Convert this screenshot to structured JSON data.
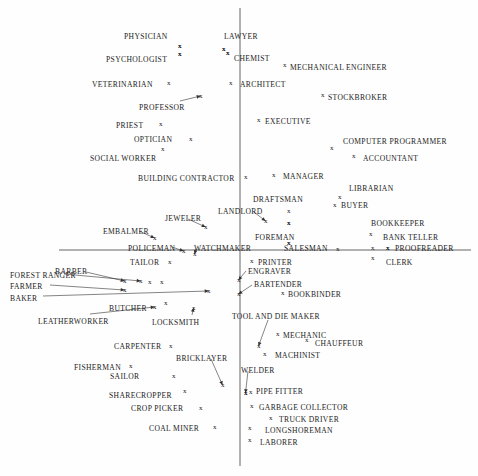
{
  "chart_data": {
    "type": "scatter",
    "title": "",
    "subtitle": "",
    "xlabel": "",
    "ylabel": "",
    "grid": false,
    "legend": "none",
    "axes": {
      "vertical_line_x": 240,
      "vertical_line_y0": 8,
      "vertical_line_y1": 466,
      "horizontal_line_y": 250,
      "horizontal_line_x0": 59,
      "horizontal_line_x1": 471,
      "color": "#555555"
    },
    "marker_glyph": "x",
    "points": [
      {
        "label": "PHYSICIAN",
        "lx": 124,
        "ly": 33,
        "mx": 178,
        "my": 43,
        "leader": false
      },
      {
        "label": "LAWYER",
        "lx": 224,
        "ly": 33,
        "mx": 222,
        "my": 46,
        "leader": false
      },
      {
        "label": "PSYCHOLOGIST",
        "lx": 106,
        "ly": 56,
        "mx": 178,
        "my": 51,
        "leader": false
      },
      {
        "label": "CHEMIST",
        "lx": 234,
        "ly": 55,
        "mx": 226,
        "my": 50,
        "leader": false
      },
      {
        "label": "MECHANICAL ENGINEER",
        "lx": 290,
        "ly": 64,
        "mx": 283,
        "my": 62,
        "leader": false
      },
      {
        "label": "VETERINARIAN",
        "lx": 92,
        "ly": 81,
        "mx": 167,
        "my": 80,
        "leader": false
      },
      {
        "label": "ARCHITECT",
        "lx": 240,
        "ly": 81,
        "mx": 229,
        "my": 80,
        "leader": false
      },
      {
        "label": "STOCKBROKER",
        "lx": 328,
        "ly": 94,
        "mx": 321,
        "my": 92,
        "leader": false
      },
      {
        "label": "PROFESSOR",
        "lx": 139,
        "ly": 104,
        "mx": 199,
        "my": 93,
        "leader": true,
        "lsx": 180,
        "lsy": 101
      },
      {
        "label": "PRIEST",
        "lx": 116,
        "ly": 122,
        "mx": 159,
        "my": 121,
        "leader": false
      },
      {
        "label": "EXECUTIVE",
        "lx": 265,
        "ly": 118,
        "mx": 257,
        "my": 117,
        "leader": false
      },
      {
        "label": "OPTICIAN",
        "lx": 134,
        "ly": 136,
        "mx": 189,
        "my": 136,
        "leader": false
      },
      {
        "label": "COMPUTER PROGRAMMER",
        "lx": 343,
        "ly": 138,
        "mx": 330,
        "my": 145,
        "leader": false
      },
      {
        "label": "SOCIAL WORKER",
        "lx": 90,
        "ly": 155,
        "mx": 161,
        "my": 146,
        "leader": false
      },
      {
        "label": "ACCOUNTANT",
        "lx": 363,
        "ly": 155,
        "mx": 352,
        "my": 153,
        "leader": false
      },
      {
        "label": "BUILDING CONTRACTOR",
        "lx": 138,
        "ly": 175,
        "mx": 244,
        "my": 174,
        "leader": false
      },
      {
        "label": "MANAGER",
        "lx": 283,
        "ly": 173,
        "mx": 272,
        "my": 172,
        "leader": false
      },
      {
        "label": "LIBRARIAN",
        "lx": 349,
        "ly": 185,
        "mx": 338,
        "my": 194,
        "leader": false
      },
      {
        "label": "DRAFTSMAN",
        "lx": 253,
        "ly": 196,
        "mx": 287,
        "my": 208,
        "leader": false
      },
      {
        "label": "BUYER",
        "lx": 341,
        "ly": 202,
        "mx": 333,
        "my": 202,
        "leader": false
      },
      {
        "label": "LANDLORD",
        "lx": 218,
        "ly": 208,
        "mx": 264,
        "my": 218,
        "leader": true,
        "lsx": 254,
        "lsy": 212
      },
      {
        "label": "JEWELER",
        "lx": 165,
        "ly": 215,
        "mx": 204,
        "my": 224,
        "leader": true,
        "lsx": 188,
        "lsy": 219
      },
      {
        "label": "BOOKKEEPER",
        "lx": 371,
        "ly": 220,
        "mx": 287,
        "my": 220,
        "leader": false
      },
      {
        "label": "EMBALMER",
        "lx": 103,
        "ly": 228,
        "mx": 153,
        "my": 235,
        "leader": true,
        "lsx": 139,
        "lsy": 231
      },
      {
        "label": "BANK TELLER",
        "lx": 383,
        "ly": 234,
        "mx": 369,
        "my": 231,
        "leader": false
      },
      {
        "label": "FOREMAN",
        "lx": 255,
        "ly": 234,
        "mx": 287,
        "my": 240,
        "leader": false
      },
      {
        "label": "POLICEMAN",
        "lx": 128,
        "ly": 245,
        "mx": 182,
        "my": 248,
        "leader": true,
        "lsx": 172,
        "lsy": 247
      },
      {
        "label": "WATCHMAKER",
        "lx": 194,
        "ly": 245,
        "mx": 193,
        "my": 251,
        "leader": true,
        "lsx": 196,
        "lsy": 249
      },
      {
        "label": "SALESMAN",
        "lx": 284,
        "ly": 245,
        "mx": 336,
        "my": 246,
        "leader": false
      },
      {
        "label": "PROOFREADER",
        "lx": 395,
        "ly": 245,
        "mx": 386,
        "my": 245,
        "leader": false
      },
      {
        "label": "TAILOR",
        "lx": 130,
        "ly": 259,
        "mx": 168,
        "my": 259,
        "leader": false
      },
      {
        "label": "PRINTER",
        "lx": 258,
        "ly": 259,
        "mx": 250,
        "my": 258,
        "leader": false
      },
      {
        "label": "CLERK",
        "lx": 386,
        "ly": 259,
        "mx": 371,
        "my": 255,
        "leader": false
      },
      {
        "label": "BARBER",
        "lx": 55,
        "ly": 268,
        "mx": 123,
        "my": 278,
        "leader": true,
        "lsx": 86,
        "lsy": 272
      },
      {
        "label": "ENGRAVER",
        "lx": 248,
        "ly": 268,
        "mx": 237,
        "my": 277,
        "leader": true,
        "lsx": 246,
        "lsy": 271
      },
      {
        "label": "FOREST RANGER",
        "lx": 10,
        "ly": 272,
        "mx": 139,
        "my": 278,
        "leader": true,
        "lsx": 64,
        "lsy": 274
      },
      {
        "label": "BARTENDER",
        "lx": 254,
        "ly": 281,
        "mx": 237,
        "my": 291,
        "leader": true,
        "lsx": 252,
        "lsy": 285
      },
      {
        "label": "FARMER",
        "lx": 10,
        "ly": 283,
        "mx": 123,
        "my": 287,
        "leader": true,
        "lsx": 50,
        "lsy": 285
      },
      {
        "label": "BOOKBINDER",
        "lx": 288,
        "ly": 291,
        "mx": 281,
        "my": 290,
        "leader": false
      },
      {
        "label": "BAKER",
        "lx": 10,
        "ly": 295,
        "mx": 207,
        "my": 288,
        "leader": true,
        "lsx": 43,
        "lsy": 296
      },
      {
        "label": "BUTCHER",
        "lx": 109,
        "ly": 305,
        "mx": 164,
        "my": 300,
        "leader": false
      },
      {
        "label": "LEATHERWORKER",
        "lx": 38,
        "ly": 318,
        "mx": 153,
        "my": 304,
        "leader": true,
        "lsx": 90,
        "lsy": 314
      },
      {
        "label": "TOOL AND DIE MAKER",
        "lx": 232,
        "ly": 313,
        "mx": 257,
        "my": 343,
        "leader": true,
        "lsx": 268,
        "lsy": 320
      },
      {
        "label": "LOCKSMITH",
        "lx": 152,
        "ly": 319,
        "mx": 192,
        "my": 305,
        "leader": true,
        "lsx": 192,
        "lsy": 315
      },
      {
        "label": "MECHANIC",
        "lx": 283,
        "ly": 332,
        "mx": 276,
        "my": 331,
        "leader": false
      },
      {
        "label": "CHAUFFEUR",
        "lx": 315,
        "ly": 340,
        "mx": 305,
        "my": 337,
        "leader": false
      },
      {
        "label": "MACHINIST",
        "lx": 275,
        "ly": 352,
        "mx": 263,
        "my": 351,
        "leader": false
      },
      {
        "label": "CARPENTER",
        "lx": 114,
        "ly": 343,
        "mx": 169,
        "my": 343,
        "leader": false
      },
      {
        "label": "BRICKLAYER",
        "lx": 176,
        "ly": 355,
        "mx": 221,
        "my": 382,
        "leader": true,
        "lsx": 211,
        "lsy": 359
      },
      {
        "label": "FISHERMAN",
        "lx": 74,
        "ly": 364,
        "mx": 129,
        "my": 363,
        "leader": false
      },
      {
        "label": "WELDER",
        "lx": 241,
        "ly": 367,
        "mx": 244,
        "my": 390,
        "leader": true,
        "lsx": 248,
        "lsy": 371
      },
      {
        "label": "SAILOR",
        "lx": 110,
        "ly": 373,
        "mx": 172,
        "my": 373,
        "leader": false
      },
      {
        "label": "PIPE FITTER",
        "lx": 256,
        "ly": 388,
        "mx": 249,
        "my": 389,
        "leader": false
      },
      {
        "label": "SHARECROPPER",
        "lx": 109,
        "ly": 392,
        "mx": 183,
        "my": 388,
        "leader": false
      },
      {
        "label": "CROP PICKER",
        "lx": 131,
        "ly": 405,
        "mx": 199,
        "my": 405,
        "leader": false
      },
      {
        "label": "GARBAGE COLLECTOR",
        "lx": 259,
        "ly": 404,
        "mx": 250,
        "my": 403,
        "leader": false
      },
      {
        "label": "TRUCK DRIVER",
        "lx": 279,
        "ly": 416,
        "mx": 269,
        "my": 415,
        "leader": false
      },
      {
        "label": "COAL MINER",
        "lx": 149,
        "ly": 425,
        "mx": 213,
        "my": 424,
        "leader": false
      },
      {
        "label": "LONGSHOREMAN",
        "lx": 265,
        "ly": 427,
        "mx": 248,
        "my": 425,
        "leader": false
      },
      {
        "label": "LABORER",
        "lx": 260,
        "ly": 439,
        "mx": 248,
        "my": 437,
        "leader": false
      }
    ],
    "extra_markers": [
      {
        "mx": 178,
        "my": 43
      },
      {
        "mx": 178,
        "my": 51
      },
      {
        "mx": 222,
        "my": 46
      },
      {
        "mx": 226,
        "my": 50
      },
      {
        "mx": 287,
        "my": 220
      },
      {
        "mx": 287,
        "my": 240
      },
      {
        "mx": 386,
        "my": 245
      },
      {
        "mx": 371,
        "my": 245
      },
      {
        "mx": 148,
        "my": 279
      },
      {
        "mx": 160,
        "my": 279
      },
      {
        "mx": 244,
        "my": 390
      }
    ]
  }
}
